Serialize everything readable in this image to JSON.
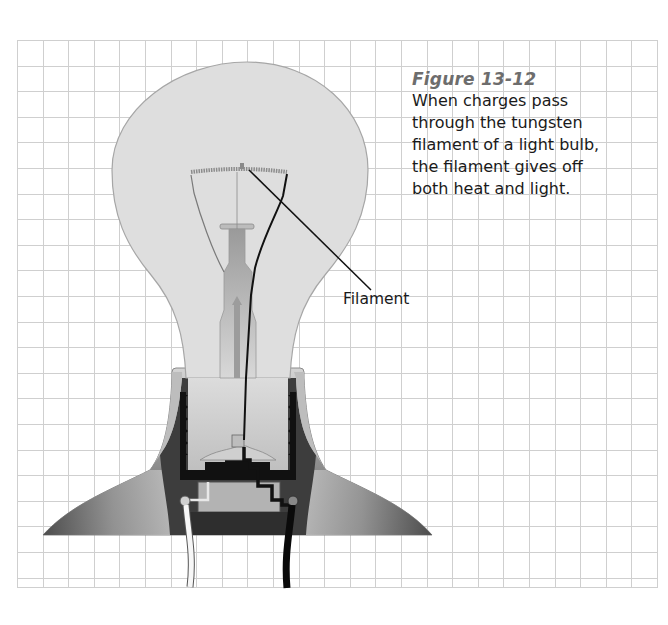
{
  "figure": {
    "number_label": "Figure 13-12",
    "caption": "When charges pass through the tungsten filament of a light bulb, the filament gives off both heat and light.",
    "caption_lines": [
      "When charges pass",
      "through the tungsten",
      "filament of a light bulb,",
      "the filament gives off",
      "both heat and light."
    ],
    "callouts": [
      {
        "label": "Filament",
        "points_to": "filament"
      }
    ],
    "illustration": {
      "subject": "incandescent-light-bulb-cutaway",
      "parts": [
        "glass-bulb",
        "filament",
        "support-wires",
        "glass-stem",
        "screw-base",
        "socket",
        "white-wire",
        "black-wire"
      ],
      "background": "graph-paper-grid"
    }
  },
  "colors": {
    "title": "#6d6d6d",
    "text": "#1a1a1a",
    "grid": "#cfcfcf",
    "glass": "#dedede",
    "socket_dark": "#3a3a3a",
    "socket_light": "#a8a8a8"
  }
}
